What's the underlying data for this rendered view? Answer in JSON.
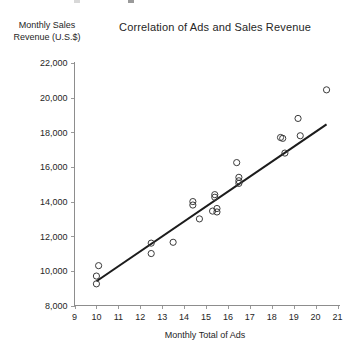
{
  "chart_data": {
    "type": "scatter",
    "title": "Correlation of Ads and Sales Revenue",
    "xlabel": "Monthly Total of Ads",
    "ylabel": "Monthly Sales Revenue (U.S.$)",
    "ylabel_line1": "Monthly Sales",
    "ylabel_line2": "Revenue (U.S.$)",
    "xlim": [
      9,
      21
    ],
    "ylim": [
      8000,
      22000
    ],
    "grid": false,
    "legend": "none",
    "xticks": [
      9,
      10,
      11,
      12,
      13,
      14,
      15,
      16,
      17,
      18,
      19,
      20,
      21
    ],
    "xtick_labels": [
      "9",
      "10",
      "11",
      "12",
      "13",
      "14",
      "15",
      "16",
      "17",
      "18",
      "19",
      "20",
      "21"
    ],
    "yticks": [
      8000,
      10000,
      12000,
      14000,
      16000,
      18000,
      20000,
      22000
    ],
    "ytick_labels": [
      "8,000",
      "10,000",
      "12,000",
      "14,000",
      "16,000",
      "18,000",
      "20,000",
      "22,000"
    ],
    "marker": "open-circle",
    "marker_color": "#3a3a3a",
    "points": [
      {
        "x": 10.0,
        "y": 9250
      },
      {
        "x": 10.0,
        "y": 9700
      },
      {
        "x": 10.1,
        "y": 10300
      },
      {
        "x": 12.5,
        "y": 11600
      },
      {
        "x": 12.5,
        "y": 11000
      },
      {
        "x": 13.5,
        "y": 11650
      },
      {
        "x": 14.4,
        "y": 14000
      },
      {
        "x": 14.4,
        "y": 13800
      },
      {
        "x": 14.7,
        "y": 13000
      },
      {
        "x": 15.3,
        "y": 13450
      },
      {
        "x": 15.4,
        "y": 14400
      },
      {
        "x": 15.4,
        "y": 14250
      },
      {
        "x": 15.5,
        "y": 13600
      },
      {
        "x": 15.5,
        "y": 13400
      },
      {
        "x": 16.4,
        "y": 16250
      },
      {
        "x": 16.5,
        "y": 15400
      },
      {
        "x": 16.5,
        "y": 15200
      },
      {
        "x": 16.5,
        "y": 15050
      },
      {
        "x": 18.4,
        "y": 17700
      },
      {
        "x": 18.5,
        "y": 17650
      },
      {
        "x": 18.6,
        "y": 16800
      },
      {
        "x": 19.2,
        "y": 18800
      },
      {
        "x": 19.3,
        "y": 17800
      },
      {
        "x": 20.5,
        "y": 20450
      }
    ],
    "trendline": {
      "visible": true,
      "color": "#1c1c1c",
      "x_start": 10.0,
      "y_start": 9400,
      "x_end": 20.5,
      "y_end": 18450
    }
  }
}
